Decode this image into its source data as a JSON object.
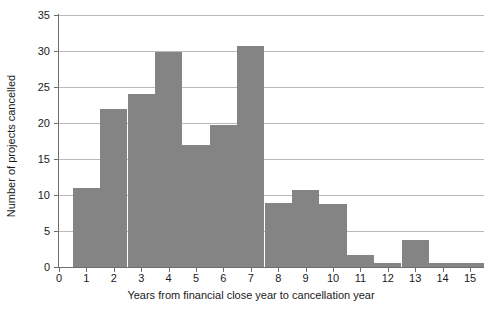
{
  "chart_data": {
    "type": "bar",
    "title": "",
    "xlabel": "Years from financial close year to cancellation year",
    "ylabel": "Number of projects cancelled",
    "categories": [
      "1",
      "2",
      "3",
      "4",
      "5",
      "6",
      "7",
      "8",
      "9",
      "10",
      "11",
      "12",
      "13",
      "14",
      "15"
    ],
    "values": [
      11,
      22,
      24,
      29.8,
      17,
      19.7,
      30.7,
      8.9,
      10.7,
      8.7,
      1.7,
      0.6,
      3.7,
      0.5,
      0.5
    ],
    "xlim": [
      -0.2,
      15.5
    ],
    "ylim": [
      0,
      35
    ],
    "xticks": [
      "0",
      "1",
      "2",
      "3",
      "4",
      "5",
      "6",
      "7",
      "8",
      "9",
      "10",
      "11",
      "12",
      "13",
      "14",
      "15"
    ],
    "yticks": [
      "0",
      "5",
      "10",
      "15",
      "20",
      "25",
      "30",
      "35"
    ],
    "grid": "horizontal",
    "legend": "none",
    "bar_color": "#848484",
    "axis_color": "#6e6e6e",
    "grid_color": "#b9b9b9",
    "bin_width": 1,
    "bin_offset": -0.5
  }
}
